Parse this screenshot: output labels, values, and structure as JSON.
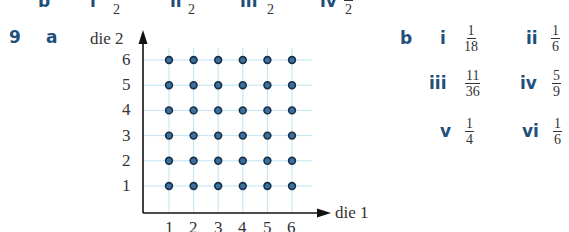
{
  "top_partial_row": {
    "part_label": "b",
    "items": [
      {
        "label": "i",
        "denominator": "2"
      },
      {
        "label": "ii",
        "denominator": "2"
      },
      {
        "label": "iii",
        "denominator": "2"
      },
      {
        "label": "iv",
        "denominator": "2"
      }
    ]
  },
  "question": {
    "number": "9",
    "part_a": {
      "label": "a",
      "y_axis_label": "die 2",
      "x_axis_label": "die 1",
      "x_ticks": [
        "1",
        "2",
        "3",
        "4",
        "5",
        "6"
      ],
      "y_ticks": [
        "1",
        "2",
        "3",
        "4",
        "5",
        "6"
      ]
    },
    "part_b": {
      "label": "b",
      "answers": [
        {
          "label": "i",
          "numerator": "1",
          "denominator": "18"
        },
        {
          "label": "ii",
          "numerator": "1",
          "denominator": "6"
        },
        {
          "label": "iii",
          "numerator": "11",
          "denominator": "36"
        },
        {
          "label": "iv",
          "numerator": "5",
          "denominator": "9"
        },
        {
          "label": "v",
          "numerator": "1",
          "denominator": "4"
        },
        {
          "label": "vi",
          "numerator": "1",
          "denominator": "6"
        }
      ]
    }
  },
  "colors": {
    "label_blue": "#1f4f7a",
    "grid_line": "#bfe3f2",
    "dot_fill": "#3d6f9a",
    "dot_stroke": "#14304a",
    "axis": "#111111"
  }
}
